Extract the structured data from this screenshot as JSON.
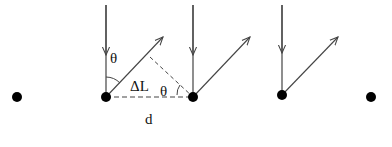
{
  "diagram": {
    "type": "physics-geometry",
    "labels": {
      "theta_top": "θ",
      "delta_L": "ΔL",
      "theta_right": "θ",
      "spacing": "d"
    },
    "atoms": [
      {
        "x": 17,
        "y": 97
      },
      {
        "x": 106,
        "y": 97
      },
      {
        "x": 193,
        "y": 97
      },
      {
        "x": 282,
        "y": 95
      },
      {
        "x": 371,
        "y": 97
      }
    ],
    "colors": {
      "line": "#444444",
      "atom": "#000000",
      "text": "#111111"
    }
  }
}
